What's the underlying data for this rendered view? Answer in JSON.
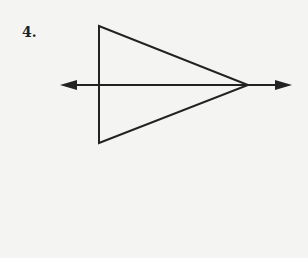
{
  "problem": {
    "number_label": "4."
  },
  "diagram": {
    "stroke_color": "#222222",
    "background_color": "#f4f4f2",
    "triangle": {
      "vertices": [
        [
          99,
          26
        ],
        [
          99,
          143
        ],
        [
          248,
          85
        ]
      ]
    },
    "line": {
      "y": 85,
      "x_start": 60,
      "x_end": 292,
      "arrows": [
        "left",
        "right"
      ]
    }
  }
}
